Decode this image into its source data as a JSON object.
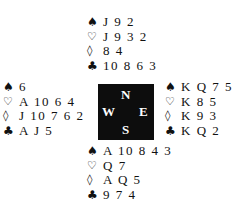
{
  "suit_symbols": {
    "spades": "♠",
    "hearts": "♡",
    "diamonds": "◊",
    "clubs": "♣"
  },
  "compass": {
    "north": "N",
    "west": "W",
    "east": "E",
    "south": "S",
    "background_color": "#0d0d0d"
  },
  "hands": {
    "north": {
      "spades": "J 9 2",
      "hearts": "J 9 3 2",
      "diamonds": "8 4",
      "clubs": "10 8 6 3"
    },
    "west": {
      "spades": "6",
      "hearts": "A 10 6 4",
      "diamonds": "J 10 7 6 2",
      "clubs": "A J 5"
    },
    "east": {
      "spades": "K Q 7 5",
      "hearts": "K 8 5",
      "diamonds": "K 9 3",
      "clubs": "K Q 2"
    },
    "south": {
      "spades": "A 10 8 4 3",
      "hearts": "Q 7",
      "diamonds": "A Q 5",
      "clubs": "9 7 4"
    }
  }
}
